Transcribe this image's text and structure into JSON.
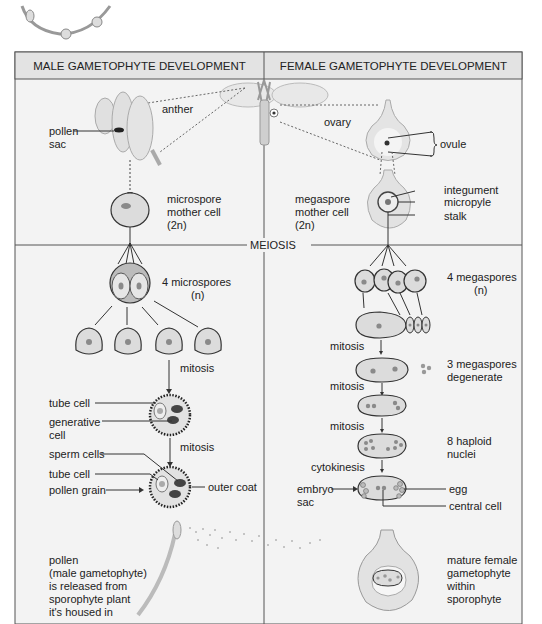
{
  "header": {
    "male_title": "MALE GAMETOPHYTE DEVELOPMENT",
    "female_title": "FEMALE GAMETOPHYTE DEVELOPMENT"
  },
  "divider": {
    "meiosis_label": "MEIOSIS"
  },
  "male": {
    "anther": "anther",
    "pollen_sac_1": "pollen",
    "pollen_sac_2": "sac",
    "microspore_mother_1": "microspore",
    "microspore_mother_2": "mother cell",
    "microspore_mother_3": "(2n)",
    "microspores_1": "4 microspores",
    "microspores_2": "(n)",
    "mitosis_1": "mitosis",
    "tube_cell_a": "tube cell",
    "generative_cell_1": "generative",
    "generative_cell_2": "cell",
    "mitosis_2": "mitosis",
    "sperm_cells": "sperm cells",
    "tube_cell_b": "tube cell",
    "pollen_grain": "pollen grain",
    "outer_coat": "outer coat",
    "release_text": [
      "pollen",
      "(male gametophyte)",
      "is released from",
      "sporophyte plant",
      "it's housed in"
    ]
  },
  "female": {
    "ovary": "ovary",
    "ovule": "ovule",
    "integument": "integument",
    "micropyle": "micropyle",
    "stalk": "stalk",
    "megaspore_mother_1": "megaspore",
    "megaspore_mother_2": "mother cell",
    "megaspore_mother_3": "(2n)",
    "megaspores_1": "4 megaspores",
    "megaspores_2": "(n)",
    "mitosis_1": "mitosis",
    "degenerate_1": "3 megaspores",
    "degenerate_2": "degenerate",
    "mitosis_2": "mitosis",
    "mitosis_3": "mitosis",
    "haploid_1": "8 haploid",
    "haploid_2": "nuclei",
    "cytokinesis": "cytokinesis",
    "embryo_sac_1": "embryo",
    "embryo_sac_2": "sac",
    "egg": "egg",
    "central_cell": "central cell",
    "mature_text": [
      "mature female",
      "gametophyte",
      "within",
      "sporophyte"
    ]
  },
  "colors": {
    "header_bg": "#e3e3e3",
    "panel_bg": "#f3f3f3",
    "border": "#555555",
    "cell_fill": "#dcdcdc",
    "cell_stroke": "#333333",
    "nucleus": "#8a8a8a"
  }
}
